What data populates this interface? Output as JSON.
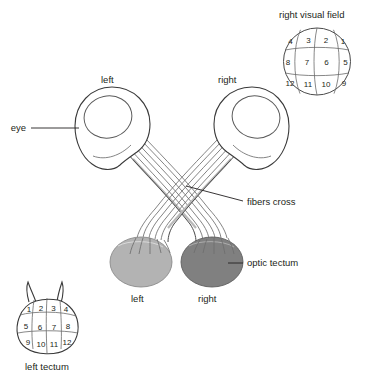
{
  "figure": {
    "title_visual_field": "right visual field",
    "caption_left_tectum": "left tectum"
  },
  "labels": {
    "eye": "eye",
    "fibers_cross": "fibers cross",
    "optic_tectum": "optic tectum",
    "eye_left": "left",
    "eye_right": "right",
    "tectum_left": "left",
    "tectum_right": "right"
  },
  "visual_field": {
    "name": "right visual field",
    "rows": [
      [
        "4",
        "3",
        "2",
        "1"
      ],
      [
        "8",
        "7",
        "6",
        "5"
      ],
      [
        "12",
        "11",
        "10",
        "9"
      ]
    ]
  },
  "left_tectum_map": {
    "name": "left tectum",
    "rows": [
      [
        "1",
        "2",
        "3",
        "4"
      ],
      [
        "5",
        "6",
        "7",
        "8"
      ],
      [
        "9",
        "10",
        "11",
        "12"
      ]
    ]
  },
  "colors": {
    "tectum_left_fill": "#b3b3b3",
    "tectum_right_fill": "#808080",
    "outline": "#3a3a3a",
    "fiber": "#6e6e6e",
    "text": "#231f20",
    "background": "#ffffff"
  }
}
